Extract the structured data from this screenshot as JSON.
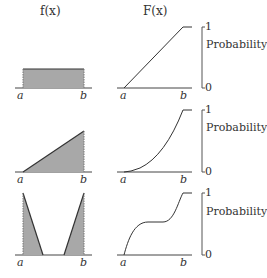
{
  "headers": {
    "pdf": "f(x)",
    "cdf": "F(x)"
  },
  "axis_labels": {
    "a": "a",
    "b": "b",
    "top": "1",
    "bottom": "0",
    "probability": "Probability"
  },
  "colors": {
    "fill": "#a8a8a8",
    "line": "#3a3a3a"
  },
  "rows": [
    {
      "name": "uniform",
      "pdf_shape": "rectangle",
      "cdf_shape": "linear"
    },
    {
      "name": "increasing-linear",
      "pdf_shape": "right-triangle",
      "cdf_shape": "quadratic"
    },
    {
      "name": "u-shaped",
      "pdf_shape": "two-triangles",
      "cdf_shape": "s-curve-with-plateau"
    }
  ]
}
